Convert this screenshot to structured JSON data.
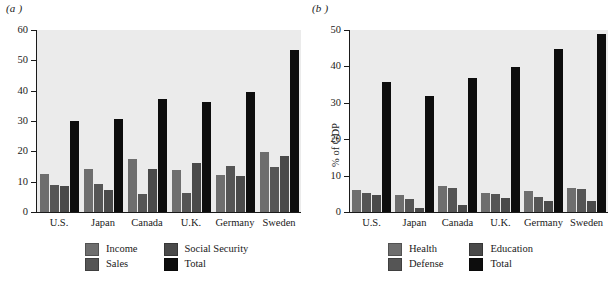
{
  "figure": {
    "panel_a_label": "(a )",
    "panel_b_label": "(b )"
  },
  "chart_data": [
    {
      "type": "bar",
      "panel": "(a )",
      "title": "",
      "xlabel": "",
      "ylabel": "",
      "ylim": [
        0,
        60
      ],
      "yticks": [
        0,
        10,
        20,
        30,
        40,
        50,
        60
      ],
      "grid": false,
      "legend_position": "bottom",
      "categories": [
        "U.S.",
        "Japan",
        "Canada",
        "U.K.",
        "Germany",
        "Sweden"
      ],
      "series": [
        {
          "name": "Income",
          "color": "#6e6e6e",
          "values": [
            12.5,
            14.3,
            17.5,
            13.7,
            12.3,
            19.8
          ]
        },
        {
          "name": "Sales",
          "color": "#555555",
          "values": [
            9.0,
            9.4,
            5.8,
            6.4,
            15.2,
            14.8
          ]
        },
        {
          "name": "Social Security",
          "color": "#4a4a4a",
          "values": [
            8.5,
            7.3,
            14.3,
            16.1,
            11.8,
            18.5
          ]
        },
        {
          "name": "Total",
          "color": "#0d0d0d",
          "values": [
            29.9,
            30.8,
            37.2,
            36.3,
            39.5,
            53.3
          ]
        }
      ]
    },
    {
      "type": "bar",
      "panel": "(b )",
      "title": "",
      "xlabel": "",
      "ylabel": "% of GDP",
      "ylim": [
        0,
        50
      ],
      "yticks": [
        0,
        10,
        20,
        30,
        40,
        50
      ],
      "grid": false,
      "legend_position": "bottom",
      "categories": [
        "U.S.",
        "Japan",
        "Canada",
        "U.K.",
        "Germany",
        "Sweden"
      ],
      "series": [
        {
          "name": "Health",
          "color": "#6e6e6e",
          "values": [
            6.0,
            4.6,
            7.1,
            5.3,
            5.9,
            6.6
          ]
        },
        {
          "name": "Defense",
          "color": "#555555",
          "values": [
            5.3,
            3.7,
            6.5,
            5.0,
            4.0,
            6.4
          ]
        },
        {
          "name": "Education",
          "color": "#4a4a4a",
          "values": [
            4.8,
            1.2,
            1.9,
            3.8,
            3.0,
            2.9
          ]
        },
        {
          "name": "Total",
          "color": "#0d0d0d",
          "values": [
            35.7,
            32.0,
            36.8,
            39.9,
            44.8,
            48.8
          ]
        }
      ]
    }
  ]
}
